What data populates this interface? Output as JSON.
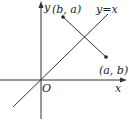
{
  "diagram": {
    "type": "coordinate-plane",
    "axes": {
      "x_label": "x",
      "y_label": "y",
      "origin_label": "O"
    },
    "line": {
      "label": "y=x"
    },
    "points": [
      {
        "label": "(b, a)"
      },
      {
        "label": "(a, b)"
      }
    ],
    "colors": {
      "stroke": "#333333",
      "text": "#222222"
    }
  }
}
